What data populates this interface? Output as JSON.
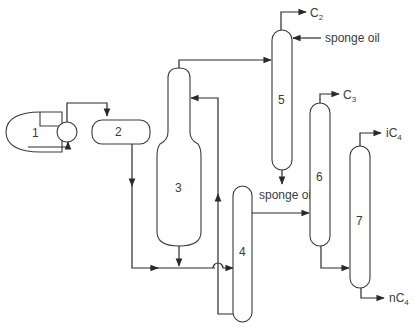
{
  "diagram": {
    "type": "process-flow",
    "units": [
      {
        "id": "1",
        "label": "1",
        "kind": "compressor"
      },
      {
        "id": "2",
        "label": "2",
        "kind": "horizontal-drum"
      },
      {
        "id": "3",
        "label": "3",
        "kind": "absorber-column"
      },
      {
        "id": "4",
        "label": "4",
        "kind": "column"
      },
      {
        "id": "5",
        "label": "5",
        "kind": "sponge-absorber-column"
      },
      {
        "id": "6",
        "label": "6",
        "kind": "column"
      },
      {
        "id": "7",
        "label": "7",
        "kind": "column"
      }
    ],
    "streams": {
      "c2": {
        "main": "C",
        "sub": "2"
      },
      "c3": {
        "main": "C",
        "sub": "3"
      },
      "ic4": {
        "main": "iC",
        "sub": "4"
      },
      "nc4": {
        "main": "nC",
        "sub": "4"
      },
      "sponge_oil_in": "sponge oil",
      "sponge_oil_out": "sponge oil"
    },
    "colors": {
      "line": "#2a2a2a",
      "background": "#ffffff"
    }
  }
}
